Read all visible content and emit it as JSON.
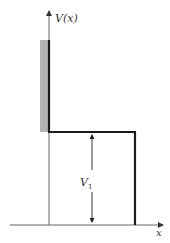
{
  "diagram": {
    "type": "potential-step",
    "y_axis_label": "V(x)",
    "x_axis_label": "x",
    "height_label": "V",
    "height_label_subscript": "1",
    "colors": {
      "wall_fill": "#b3b3b3",
      "potential_line": "#1a1a1a",
      "axis": "#555555",
      "background": "#ffffff"
    }
  }
}
